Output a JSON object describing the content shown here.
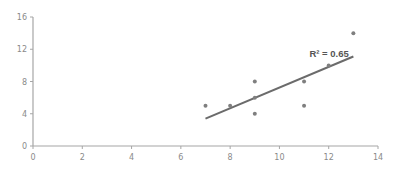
{
  "chart_data": {
    "type": "scatter",
    "title": "",
    "xlabel": "",
    "ylabel": "",
    "xlim": [
      0,
      14
    ],
    "ylim": [
      0,
      16
    ],
    "x_ticks": [
      0,
      2,
      4,
      6,
      8,
      10,
      12,
      14
    ],
    "y_ticks": [
      0,
      4,
      8,
      12,
      16
    ],
    "grid": false,
    "legend": null,
    "series": [
      {
        "name": "data",
        "points": [
          {
            "x": 7,
            "y": 5
          },
          {
            "x": 8,
            "y": 5
          },
          {
            "x": 9,
            "y": 8
          },
          {
            "x": 9,
            "y": 6
          },
          {
            "x": 9,
            "y": 4
          },
          {
            "x": 11,
            "y": 8
          },
          {
            "x": 11,
            "y": 5
          },
          {
            "x": 12,
            "y": 10
          },
          {
            "x": 13,
            "y": 14
          }
        ]
      }
    ],
    "trendline": {
      "type": "linear",
      "x_start": 7,
      "y_start": 3.4,
      "x_end": 13,
      "y_end": 11.1
    },
    "annotations": [
      {
        "text": "R² = 0.65",
        "x": 11.3,
        "y": 11.5
      }
    ],
    "colors": {
      "point": "#7f7f7f",
      "trendline": "#6b6b6b",
      "axis": "#a6a6a6",
      "tick_label": "#8a8a8a"
    }
  }
}
